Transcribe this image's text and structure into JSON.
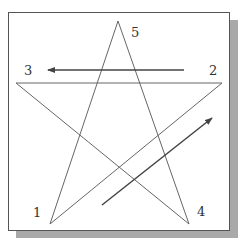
{
  "diagram": {
    "type": "pentagram-drawing-order",
    "points": [
      {
        "label": "1",
        "x": 50,
        "y": 224,
        "label_x": 33,
        "label_y": 217
      },
      {
        "label": "2",
        "x": 222,
        "y": 83,
        "label_x": 209,
        "label_y": 75
      },
      {
        "label": "3",
        "x": 16,
        "y": 83,
        "label_x": 24,
        "label_y": 75
      },
      {
        "label": "4",
        "x": 189,
        "y": 224,
        "label_x": 197,
        "label_y": 216
      },
      {
        "label": "5",
        "x": 118,
        "y": 21,
        "label_x": 131,
        "label_y": 37
      }
    ],
    "arrows": [
      {
        "name": "arrow-2-to-3",
        "x1": 184,
        "y1": 70,
        "x2": 48,
        "y2": 70
      },
      {
        "name": "arrow-1-to-2",
        "x1": 102,
        "y1": 205,
        "x2": 212,
        "y2": 118
      }
    ],
    "colors": {
      "line": "#666666",
      "arrow": "#444444",
      "border": "#555555",
      "shadow": "#a9a9a9"
    }
  }
}
